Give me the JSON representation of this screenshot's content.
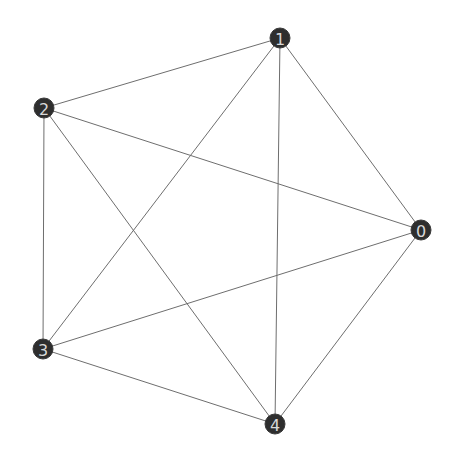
{
  "diagram": {
    "type": "graph",
    "directed": false,
    "colors": {
      "background": "#ffffff",
      "node_fill": "#2e2e2e",
      "node_label": "#d8d8d8",
      "edge": "#6e6e6e"
    },
    "node_radius": 10,
    "nodes": [
      {
        "id": "0",
        "label": "0",
        "x": 421,
        "y": 230
      },
      {
        "id": "1",
        "label": "1",
        "x": 280,
        "y": 38
      },
      {
        "id": "2",
        "label": "2",
        "x": 44,
        "y": 108
      },
      {
        "id": "3",
        "label": "3",
        "x": 43,
        "y": 349
      },
      {
        "id": "4",
        "label": "4",
        "x": 275,
        "y": 424
      }
    ],
    "edges": [
      {
        "source": "0",
        "target": "1"
      },
      {
        "source": "0",
        "target": "2"
      },
      {
        "source": "0",
        "target": "3"
      },
      {
        "source": "0",
        "target": "4"
      },
      {
        "source": "1",
        "target": "2"
      },
      {
        "source": "1",
        "target": "3"
      },
      {
        "source": "1",
        "target": "4"
      },
      {
        "source": "2",
        "target": "3"
      },
      {
        "source": "2",
        "target": "4"
      },
      {
        "source": "3",
        "target": "4"
      }
    ]
  }
}
